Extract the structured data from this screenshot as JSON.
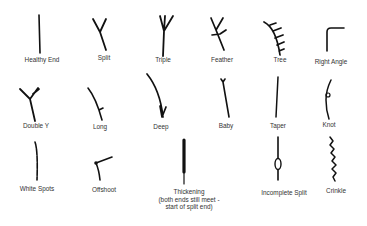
{
  "items": [
    {
      "name": "healthy-end",
      "label": "Healthy End",
      "glyph": "straight-line-icon"
    },
    {
      "name": "split",
      "label": "Split",
      "glyph": "y-fork-icon"
    },
    {
      "name": "triple",
      "label": "Triple",
      "glyph": "triple-fork-icon"
    },
    {
      "name": "feather",
      "label": "Feather",
      "glyph": "feather-branch-icon"
    },
    {
      "name": "tree",
      "label": "Tree",
      "glyph": "tree-branches-icon"
    },
    {
      "name": "right-angle",
      "label": "Right Angle",
      "glyph": "right-angle-icon"
    },
    {
      "name": "double-y",
      "label": "Double Y",
      "glyph": "double-y-fork-icon"
    },
    {
      "name": "long",
      "label": "Long",
      "glyph": "long-split-icon"
    },
    {
      "name": "deep",
      "label": "Deep",
      "glyph": "deep-split-icon"
    },
    {
      "name": "baby",
      "label": "Baby",
      "glyph": "baby-split-icon"
    },
    {
      "name": "taper",
      "label": "Taper",
      "glyph": "taper-line-icon"
    },
    {
      "name": "knot",
      "label": "Knot",
      "glyph": "knot-icon"
    },
    {
      "name": "white-spots",
      "label": "White Spots",
      "glyph": "white-spots-line-icon"
    },
    {
      "name": "offshoot",
      "label": "Offshoot",
      "glyph": "offshoot-icon"
    },
    {
      "name": "thickening",
      "label": "Thickening\n(both ends still meet -\nstart of split end)",
      "label_lines": [
        "Thickening",
        "(both ends still meet -",
        "start of split end)"
      ],
      "glyph": "thickening-line-icon"
    },
    {
      "name": "incomplete-split",
      "label": "Incomplete Split",
      "glyph": "incomplete-split-icon"
    },
    {
      "name": "crinkle",
      "label": "Crinkle",
      "glyph": "crinkle-icon"
    }
  ]
}
